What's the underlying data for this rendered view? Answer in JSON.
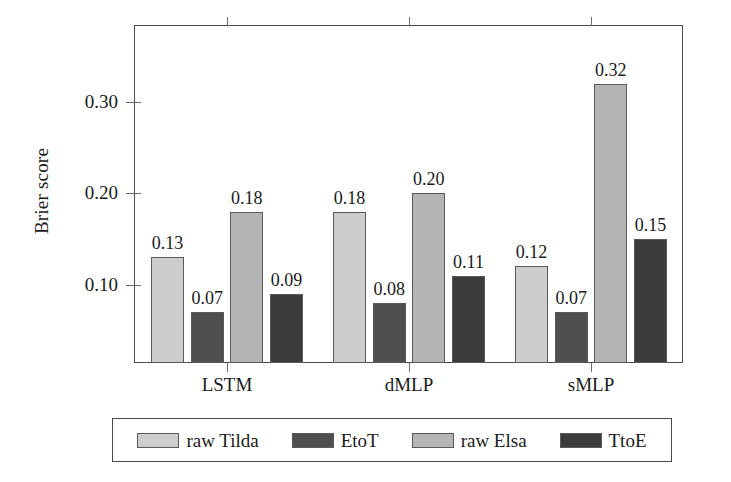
{
  "chart_data": {
    "type": "bar",
    "title": "",
    "xlabel": "",
    "ylabel": "Brier score",
    "categories": [
      "LSTM",
      "dMLP",
      "sMLP"
    ],
    "series": [
      {
        "name": "raw Tilda",
        "color": "#cdcdcd",
        "values": [
          0.13,
          0.18,
          0.12
        ]
      },
      {
        "name": "EtoT",
        "color": "#4f4f4f",
        "values": [
          0.07,
          0.08,
          0.07
        ]
      },
      {
        "name": "raw Elsa",
        "color": "#b5b5b5",
        "values": [
          0.18,
          0.2,
          0.32
        ]
      },
      {
        "name": "TtoE",
        "color": "#3b3b3b",
        "values": [
          0.09,
          0.11,
          0.15
        ]
      }
    ],
    "value_labels": [
      [
        "0.13",
        "0.07",
        "0.18",
        "0.09"
      ],
      [
        "0.18",
        "0.08",
        "0.20",
        "0.11"
      ],
      [
        "0.12",
        "0.07",
        "0.32",
        "0.15"
      ]
    ],
    "yticks": [
      0.1,
      0.2,
      0.3
    ],
    "ytick_labels": [
      "0.10",
      "0.20",
      "0.30"
    ],
    "ylim": [
      0.0,
      0.372
    ],
    "grid": false,
    "legend_position": "below"
  },
  "axis": {
    "ylabel": "Brier score",
    "ytick_labels": [
      "0.30",
      "0.20",
      "0.10"
    ],
    "xtick_labels": [
      "LSTM",
      "dMLP",
      "sMLP"
    ]
  },
  "legend": {
    "items": [
      {
        "label": "raw Tilda",
        "color": "#cdcdcd"
      },
      {
        "label": "EtoT",
        "color": "#4f4f4f"
      },
      {
        "label": "raw Elsa",
        "color": "#b5b5b5"
      },
      {
        "label": "TtoE",
        "color": "#3b3b3b"
      }
    ]
  },
  "colors": {
    "frame": "#4a4a4a",
    "tick": "#6b6b6b",
    "text": "#1a1a1a",
    "background": "#ffffff"
  }
}
